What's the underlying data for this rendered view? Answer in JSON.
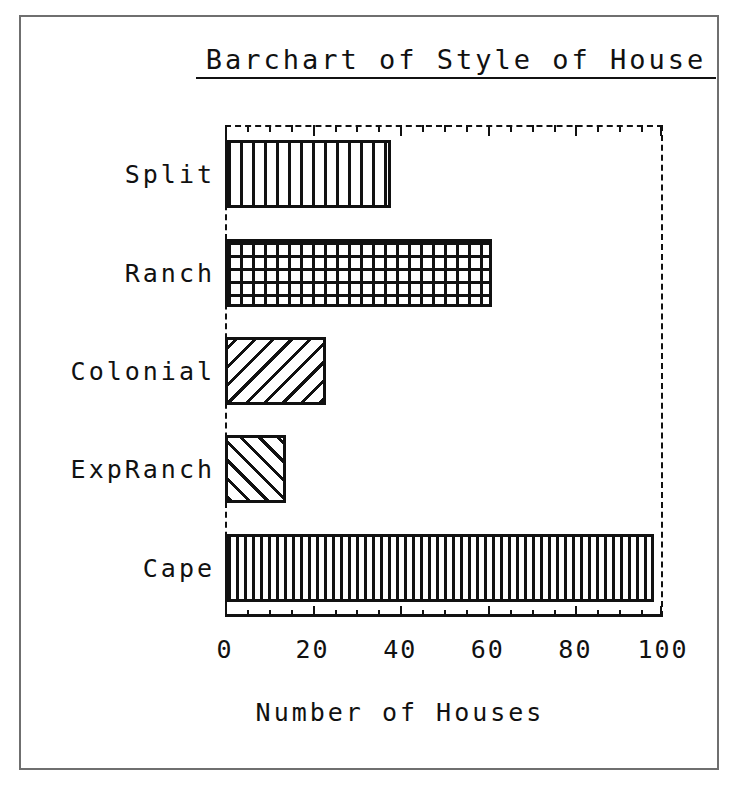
{
  "chart_data": {
    "type": "bar",
    "orientation": "horizontal",
    "title": "Barchart of Style of House",
    "xlabel": "Number of Houses",
    "ylabel": "",
    "categories": [
      "Split",
      "Ranch",
      "Colonial",
      "ExpRanch",
      "Cape"
    ],
    "values": [
      38,
      61,
      23,
      14,
      98
    ],
    "xlim": [
      0,
      100
    ],
    "xticks": [
      0,
      20,
      40,
      60,
      80,
      100
    ],
    "xticklabels": [
      "0",
      "20",
      "40",
      "60",
      "80",
      "100"
    ],
    "minor_tick_interval": 5,
    "grid": false,
    "legend": null,
    "bar_fills": [
      "vertical-lines",
      "cross-hatch-grid",
      "diagonal-backslash",
      "diagonal-forwardslash",
      "dense-vertical-lines"
    ],
    "colors": {
      "ink": "#111111",
      "background": "#ffffff",
      "frame": "#6f6f6f"
    }
  }
}
